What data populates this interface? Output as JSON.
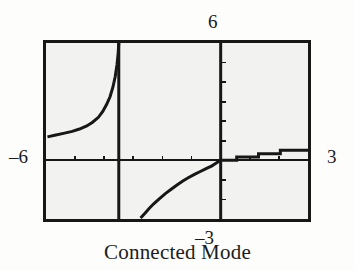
{
  "figure": {
    "caption": "Connected Mode",
    "background_color": "#fdfdfc",
    "screen_background_color": "#f2f2f0",
    "ink_color": "#171717"
  },
  "window_labels": {
    "ymax": "6",
    "ymin": "–3",
    "xmin": "–6",
    "xmax": "3"
  },
  "chart_data": {
    "type": "line",
    "title": "Connected Mode",
    "xlabel": "",
    "ylabel": "",
    "xlim": [
      -6,
      3
    ],
    "ylim": [
      -3,
      6
    ],
    "grid": false,
    "legend": false,
    "axis_color": "#171717",
    "curve_color": "#171717",
    "x_tick_interval": 1,
    "y_tick_interval": 1,
    "x_ticks": [
      -6,
      -5,
      -4,
      -3,
      -2,
      -1,
      0,
      1,
      2,
      3
    ],
    "y_ticks": [
      -3,
      -2,
      -1,
      0,
      1,
      2,
      3,
      4,
      5,
      6
    ],
    "annotations": [
      "vertical pseudo-asymptote segment drawn at x = -3.5",
      "vertical pseudo-asymptote segment drawn at x = 0 (y-axis overlap)",
      "stair-step segments to the right of x = 0"
    ],
    "series": [
      {
        "name": "upper-left branch",
        "x": [
          -5.95,
          -5.7,
          -5.4,
          -5.1,
          -4.85,
          -4.6,
          -4.4,
          -4.2,
          -4.05,
          -3.92,
          -3.8,
          -3.7,
          -3.62,
          -3.56,
          -3.52,
          -3.5
        ],
        "y": [
          1.2,
          1.28,
          1.38,
          1.48,
          1.6,
          1.76,
          1.95,
          2.2,
          2.5,
          2.85,
          3.25,
          3.75,
          4.3,
          4.9,
          5.5,
          6.0
        ]
      },
      {
        "name": "pseudo-asymptote at x = -3.5",
        "x": [
          -3.5,
          -3.5
        ],
        "y": [
          -3.0,
          6.0
        ]
      },
      {
        "name": "lower-middle branch",
        "x": [
          -2.75,
          -2.6,
          -2.45,
          -2.3,
          -2.1,
          -1.9,
          -1.7,
          -1.5,
          -1.3,
          -1.1,
          -0.9,
          -0.7,
          -0.5,
          -0.3,
          -0.15,
          0.0
        ],
        "y": [
          -2.95,
          -2.7,
          -2.45,
          -2.22,
          -1.96,
          -1.7,
          -1.48,
          -1.26,
          -1.06,
          -0.88,
          -0.72,
          -0.57,
          -0.42,
          -0.28,
          -0.14,
          0.0
        ]
      },
      {
        "name": "pseudo-asymptote at x = 0",
        "x": [
          0.0,
          0.0
        ],
        "y": [
          -3.0,
          6.0
        ]
      },
      {
        "name": "right stair-step branch",
        "x": [
          0.0,
          0.55,
          0.55,
          1.3,
          1.3,
          2.05,
          2.05,
          3.0
        ],
        "y": [
          0.0,
          0.0,
          0.17,
          0.17,
          0.34,
          0.34,
          0.52,
          0.52
        ]
      }
    ]
  }
}
